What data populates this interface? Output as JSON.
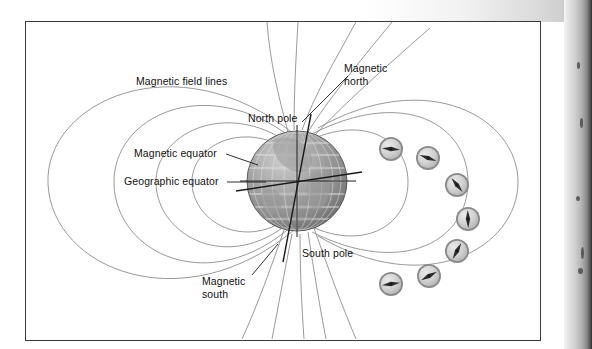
{
  "figure": {
    "background_color": "#ffffff",
    "frame_color": "#3a3a3a",
    "field_line_color": "#8d8d8d",
    "axis_line_color": "#1a1a1a",
    "globe_grid_color": "#e8e8e8",
    "compass_ring_color": "#8a8a8a",
    "compass_face_color": "#d8d8d8",
    "compass_needle_color": "#2b2b2b"
  },
  "labels": {
    "magnetic_field_lines": "Magnetic field lines",
    "magnetic_north_line1": "Magnetic",
    "magnetic_north_line2": "north",
    "north_pole": "North pole",
    "magnetic_equator": "Magnetic equator",
    "geographic_equator": "Geographic equator",
    "south_pole": "South pole",
    "magnetic_south_line1": "Magnetic",
    "magnetic_south_line2": "south"
  },
  "globe": {
    "name": "earth",
    "center_x": 296,
    "center_y": 180,
    "radius": 50,
    "geographic_axis_tilt_deg": 0,
    "magnetic_axis_tilt_deg": 11
  },
  "compasses": [
    {
      "id": 1,
      "x": 390,
      "y": 148,
      "needle_deg": 5
    },
    {
      "id": 2,
      "x": 427,
      "y": 157,
      "needle_deg": 20
    },
    {
      "id": 3,
      "x": 456,
      "y": 184,
      "needle_deg": 52
    },
    {
      "id": 4,
      "x": 467,
      "y": 218,
      "needle_deg": 88
    },
    {
      "id": 5,
      "x": 456,
      "y": 250,
      "needle_deg": 118
    },
    {
      "id": 6,
      "x": 428,
      "y": 275,
      "needle_deg": 152
    },
    {
      "id": 7,
      "x": 390,
      "y": 283,
      "needle_deg": 172
    }
  ],
  "counts": {
    "compass_count": 7,
    "field_loops_left": 4,
    "field_lines_open": 8
  }
}
